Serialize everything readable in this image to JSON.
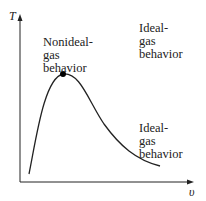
{
  "axes": {
    "y_label": "T",
    "x_label": "υ"
  },
  "labels": {
    "nonideal": "Nonideal-\ngas\nbehavior",
    "ideal_top": "Ideal-\ngas\nbehavior",
    "ideal_bottom": "Ideal-\ngas\nbehavior"
  },
  "colors": {
    "curve": "#222222",
    "axis": "#222222",
    "point": "#000000"
  }
}
